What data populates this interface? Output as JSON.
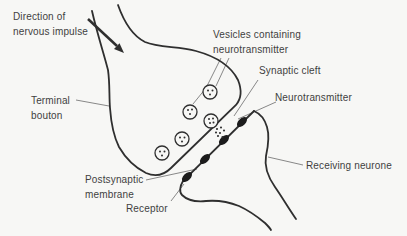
{
  "figure": {
    "type": "textbook-synapse-diagram",
    "colors": {
      "background": "#f7f7f5",
      "outline_ink": "#2f2f2f",
      "leader_line": "#7a7a7a",
      "label_text": "#3f3f3f",
      "receptor_fill": "#1c1c1c",
      "vesicle_fill": "#f7f7f5"
    },
    "labels": {
      "direction_of_impulse": "Direction of\nnervous impulse",
      "vesicles_containing": "Vesicles containing\nneurotransmitter",
      "synaptic_cleft": "Synaptic cleft",
      "neurotransmitter": "Neurotransmitter",
      "terminal_bouton": "Terminal\nbouton",
      "postsynaptic_membrane": "Postsynaptic\nmembrane",
      "receptor": "Receptor",
      "receiving_neurone": "Receiving neurone"
    },
    "structure": {
      "vesicle_count": 5,
      "fused_vesicle_count": 1,
      "receptor_count": 4,
      "neurotransmitter_dot_cluster": true,
      "impulse_arrow_direction": "down-right"
    }
  }
}
